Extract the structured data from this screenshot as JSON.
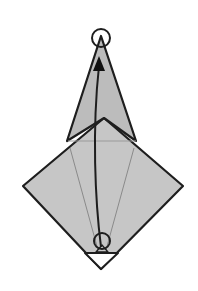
{
  "diagram": {
    "type": "origami-fold-step",
    "colors": {
      "background": "#ffffff",
      "paper_fill": "#c8c8c8",
      "kite_fill": "#bdbdbd",
      "stroke": "#1e1e1e",
      "hidden_line": "#8a8a8a",
      "triangle_fill": "#ffffff"
    },
    "markers": {
      "top_circle": {
        "cx": 101,
        "cy": 38,
        "r": 9
      },
      "bottom_circle": {
        "cx": 102,
        "cy": 241,
        "r": 8
      }
    },
    "arrow": {
      "from": [
        102,
        248
      ],
      "to": [
        99,
        58
      ],
      "style": "curved-valley-fold"
    }
  }
}
